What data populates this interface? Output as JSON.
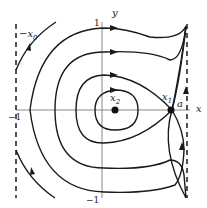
{
  "diagram": {
    "type": "phase-portrait",
    "axes": {
      "x_label": "x",
      "y_label": "y"
    },
    "ticks": {
      "x_neg": "−1",
      "y_pos": "1",
      "y_neg": "−1"
    },
    "points": [
      {
        "name": "x2",
        "label_main": "x",
        "label_sub": "2",
        "kind": "center"
      },
      {
        "name": "x1",
        "label_main": "x",
        "label_sub": "1",
        "kind": "saddle"
      }
    ],
    "labels": {
      "a": "a",
      "neg_x0_main": "−x",
      "neg_x0_sub": "0"
    },
    "colors": {
      "curve": "#1a1a1a",
      "axis": "#888888",
      "dash": "#1a1a1a"
    }
  }
}
